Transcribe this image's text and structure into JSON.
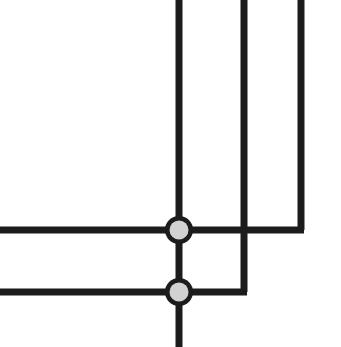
{
  "canvas": {
    "width": 341,
    "height": 347,
    "background_color": "#ffffff",
    "title": "Circuit Node Junction Diagram"
  },
  "style": {
    "line_color": "#1c1c1c",
    "line_width": 7,
    "node_fill_color": "#d2d2d2",
    "node_ring_color": "#1c1c1c",
    "node_outer_radius": 14,
    "node_inner_radius": 9.5,
    "node_ring_width": 5
  },
  "wires": [
    {
      "id": "wire-vertical-main",
      "label": "vertical-main-trunk",
      "path": "M 179 0 L 179 347"
    },
    {
      "id": "wire-horizontal-upper",
      "label": "horizontal-upper-branch",
      "path": "M 0 230 L 304 230"
    },
    {
      "id": "wire-horizontal-lower",
      "label": "horizontal-lower-branch",
      "path": "M 0 292 L 247 292"
    },
    {
      "id": "wire-elbow-middle",
      "label": "middle-vertical-to-lower-elbow",
      "path": "M 244 0 L 244 292"
    },
    {
      "id": "wire-elbow-right",
      "label": "right-vertical-to-upper-elbow",
      "path": "M 301 0 L 301 230"
    }
  ],
  "nodes": [
    {
      "id": "node-upper",
      "label": "junction-node-upper",
      "cx": 179,
      "cy": 230
    },
    {
      "id": "node-lower",
      "label": "junction-node-lower",
      "cx": 179,
      "cy": 292
    }
  ]
}
